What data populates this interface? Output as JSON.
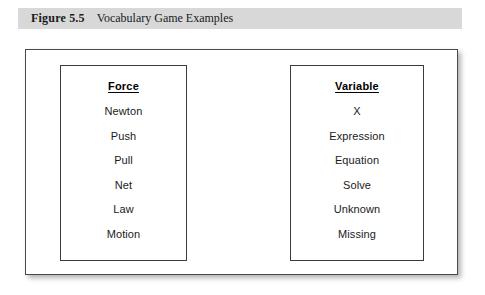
{
  "caption": {
    "number": "Figure 5.5",
    "title": "Vocabulary Game Examples"
  },
  "figure": {
    "columns": [
      {
        "heading": "Force",
        "items": [
          "Newton",
          "Push",
          "Pull",
          "Net",
          "Law",
          "Motion"
        ]
      },
      {
        "heading": "Variable",
        "items": [
          "X",
          "Expression",
          "Equation",
          "Solve",
          "Unknown",
          "Missing"
        ]
      }
    ]
  },
  "colors": {
    "caption_bar_background": "#d8d8d8",
    "frame_border": "#4a4a4a",
    "box_border": "#3b3b3b",
    "page_background": "#ffffff",
    "text": "#1a1a1a"
  }
}
